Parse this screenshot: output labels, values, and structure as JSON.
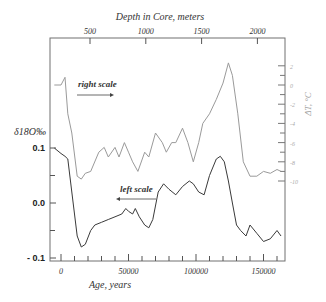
{
  "chart_data": {
    "type": "line",
    "title": "",
    "top_axis": {
      "label": "Depth in Core, meters",
      "ticks": [
        500,
        1000,
        1500,
        2000
      ]
    },
    "xlabel": "Age, years",
    "x_ticks": [
      0,
      50000,
      100000,
      150000
    ],
    "xlim": [
      -8000,
      165000
    ],
    "left_axis": {
      "label": "δ18O‰",
      "ticks": [
        "0.1",
        "0.0",
        "- 0.1"
      ],
      "ylim": [
        -0.1,
        0.2
      ]
    },
    "right_axis": {
      "label": "ΔT, °C",
      "ticks": [
        "2",
        "0",
        "-2",
        "-4",
        "-6",
        "-8",
        "-10"
      ]
    },
    "annotations": [
      {
        "text": "right scale",
        "arrow": "right"
      },
      {
        "text": "left scale",
        "arrow": "left"
      }
    ],
    "series": [
      {
        "name": "Temperature (right scale)",
        "axis": "right",
        "color": "#9a9a9a",
        "x": [
          -5000,
          0,
          3000,
          5000,
          8000,
          12000,
          15000,
          18000,
          22000,
          28000,
          32000,
          35000,
          40000,
          43000,
          47000,
          50000,
          53000,
          57000,
          62000,
          65000,
          70000,
          75000,
          78000,
          82000,
          85000,
          90000,
          94000,
          98000,
          102000,
          105000,
          110000,
          115000,
          120000,
          124000,
          127000,
          131000,
          135000,
          140000,
          145000,
          150000,
          155000,
          160000,
          163000
        ],
        "values": [
          0,
          0,
          0.8,
          -3,
          -5,
          -9.5,
          -9.8,
          -9.2,
          -9,
          -7,
          -6.5,
          -7.5,
          -6.5,
          -7.5,
          -6,
          -7,
          -8,
          -9,
          -7,
          -7.5,
          -5,
          -6,
          -7,
          -6,
          -6,
          -4.5,
          -6,
          -8,
          -6,
          -4,
          -3,
          -1.5,
          0.2,
          2.3,
          1,
          -3,
          -8,
          -9.5,
          -9.5,
          -9,
          -9.2,
          -8.8,
          -9
        ]
      },
      {
        "name": "δ18O (left scale)",
        "axis": "left",
        "color": "#3a3a3a",
        "x": [
          -5000,
          0,
          3000,
          5000,
          8000,
          12000,
          15000,
          18000,
          22000,
          25000,
          30000,
          35000,
          40000,
          45000,
          48000,
          50000,
          53000,
          55000,
          58000,
          62000,
          65000,
          68000,
          72000,
          76000,
          80000,
          85000,
          90000,
          95000,
          98000,
          102000,
          106000,
          110000,
          115000,
          118000,
          121000,
          124000,
          127000,
          130000,
          133000,
          137000,
          140000,
          145000,
          150000,
          155000,
          160000,
          163000
        ],
        "values": [
          0.1,
          0.09,
          0.085,
          0.08,
          0.02,
          -0.06,
          -0.08,
          -0.075,
          -0.05,
          -0.04,
          -0.035,
          -0.03,
          -0.025,
          -0.02,
          -0.01,
          -0.015,
          -0.02,
          -0.01,
          -0.025,
          -0.04,
          -0.045,
          -0.03,
          0.02,
          0.035,
          0.025,
          0.015,
          0.03,
          0.04,
          0.035,
          0.02,
          0.015,
          0.05,
          0.08,
          0.085,
          0.075,
          0.04,
          0.0,
          -0.04,
          -0.05,
          -0.06,
          -0.04,
          -0.055,
          -0.07,
          -0.065,
          -0.05,
          -0.06
        ]
      }
    ],
    "grid": false,
    "legend": "inline annotations"
  }
}
